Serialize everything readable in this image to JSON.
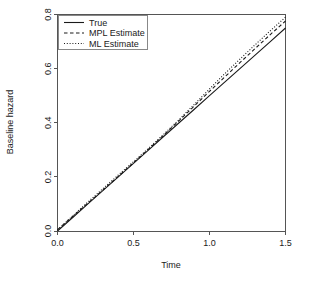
{
  "chart_data": {
    "type": "line",
    "title": "",
    "xlabel": "Time",
    "ylabel": "Baseline hazard",
    "xlim": [
      0.0,
      1.5
    ],
    "ylim": [
      0.0,
      0.8
    ],
    "xticks": [
      "0.0",
      "0.5",
      "1.0",
      "1.5"
    ],
    "xtick_values": [
      0.0,
      0.5,
      1.0,
      1.5
    ],
    "yticks": [
      "0.0",
      "0.2",
      "0.4",
      "0.6",
      "0.8"
    ],
    "ytick_values": [
      0.0,
      0.2,
      0.4,
      0.6,
      0.8
    ],
    "grid": false,
    "legend_position": "top-left",
    "x": [
      0.0,
      0.1,
      0.2,
      0.3,
      0.4,
      0.5,
      0.6,
      0.7,
      0.8,
      0.9,
      1.0,
      1.1,
      1.2,
      1.3,
      1.4,
      1.5
    ],
    "series": [
      {
        "name": "True",
        "style": "solid",
        "values": [
          0.0,
          0.05,
          0.1,
          0.15,
          0.2,
          0.25,
          0.3,
          0.35,
          0.4,
          0.45,
          0.5,
          0.55,
          0.6,
          0.65,
          0.7,
          0.75
        ]
      },
      {
        "name": "MPL Estimate",
        "style": "dashed",
        "values": [
          0.005,
          0.054,
          0.103,
          0.152,
          0.202,
          0.252,
          0.303,
          0.355,
          0.408,
          0.462,
          0.516,
          0.569,
          0.622,
          0.674,
          0.726,
          0.776
        ]
      },
      {
        "name": "ML Estimate",
        "style": "dotted",
        "values": [
          0.004,
          0.056,
          0.107,
          0.157,
          0.207,
          0.256,
          0.306,
          0.358,
          0.412,
          0.468,
          0.525,
          0.581,
          0.635,
          0.688,
          0.74,
          0.79
        ]
      }
    ]
  },
  "legend": {
    "entries": [
      {
        "label": "True"
      },
      {
        "label": "MPL Estimate"
      },
      {
        "label": "ML Estimate"
      }
    ]
  },
  "colors": {
    "background": "#ffffff",
    "ink": "#1a1a1a",
    "frame": "#555555",
    "legend_border": "#888888"
  }
}
